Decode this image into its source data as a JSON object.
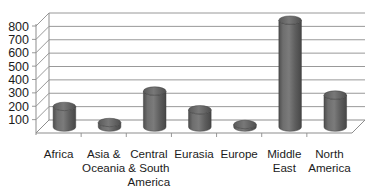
{
  "chart_data": {
    "type": "bar",
    "title": "",
    "subtitle": "",
    "xlabel": "",
    "ylabel": "",
    "categories": [
      "Africa",
      "Asia & Oceania",
      "Central & South America",
      "Eurasia",
      "Europe",
      "Middle East",
      "North America"
    ],
    "category_lines": [
      [
        "Africa"
      ],
      [
        "Asia &",
        "Oceania"
      ],
      [
        "Central",
        "& South",
        "America"
      ],
      [
        "Eurasia"
      ],
      [
        "Europe"
      ],
      [
        "Middle",
        "East"
      ],
      [
        "North",
        "America"
      ]
    ],
    "values": [
      155,
      35,
      270,
      130,
      20,
      800,
      240
    ],
    "series": [
      {
        "name": "",
        "values": [
          155,
          35,
          270,
          130,
          20,
          800,
          240
        ]
      }
    ],
    "ylim": [
      0,
      800
    ],
    "yticks": [
      100,
      200,
      300,
      400,
      500,
      600,
      700,
      800
    ],
    "ytick_labels": [
      "100",
      "200",
      "300",
      "400",
      "500",
      "600",
      "700",
      "800"
    ],
    "grid": true,
    "legend": false,
    "legend_position": "none",
    "style": "3d-cylinder",
    "bar_color": "#5f5f5f",
    "bar_color_light": "#7a7a7a",
    "bar_color_dark": "#4a4a4a",
    "grid_color": "#8d8d8d",
    "axis_color": "#8d8d8d",
    "text_color": "#1b1b1b",
    "background": "#ffffff"
  }
}
